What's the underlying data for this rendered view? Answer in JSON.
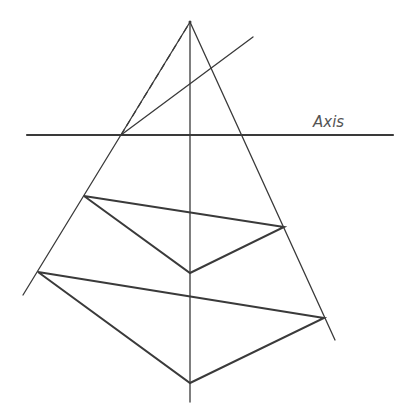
{
  "diagram": {
    "axis_label": "Axis",
    "stroke_color": "#3a3a3a",
    "apex": [
      190,
      22
    ],
    "lines": {
      "horizontal_axis": [
        27,
        135,
        393,
        135
      ],
      "vertical_axis": [
        190,
        22,
        190,
        402
      ],
      "left_side": [
        190,
        22,
        23,
        295
      ],
      "right_side": [
        190,
        22,
        335,
        340
      ],
      "oblique": [
        121,
        135,
        253,
        37
      ],
      "dashed": [
        121,
        135,
        187,
        27
      ]
    },
    "upper_triangle": [
      [
        84,
        196
      ],
      [
        284,
        227
      ],
      [
        190,
        273
      ]
    ],
    "lower_triangle": [
      [
        38,
        272
      ],
      [
        324,
        318
      ],
      [
        190,
        383
      ]
    ]
  }
}
